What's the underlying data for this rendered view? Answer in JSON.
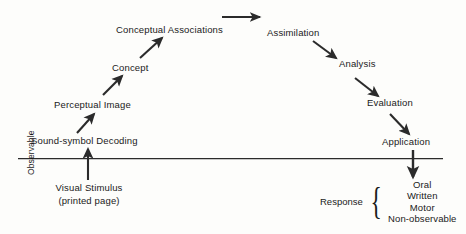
{
  "diagram": {
    "line_color": "#2b2b2b",
    "text_color": "#1a1a1a",
    "background": "#fdfdfb",
    "nodes": {
      "conceptual_associations": "Conceptual Associations",
      "concept": "Concept",
      "perceptual_image": "Perceptual Image",
      "sound_symbol_decoding": "Sound-symbol Decoding",
      "visual_stimulus": "Visual Stimulus",
      "visual_stimulus_sub": "(printed page)",
      "assimilation": "Assimilation",
      "analysis": "Analysis",
      "evaluation": "Evaluation",
      "application": "Application"
    },
    "axis": {
      "observable_label": "Observable"
    },
    "response": {
      "label": "Response",
      "brace": "{",
      "items": [
        "Oral",
        "Written",
        "Motor",
        "Non-observable"
      ]
    }
  }
}
